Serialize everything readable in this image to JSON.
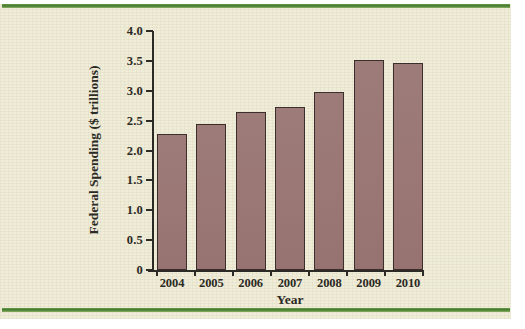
{
  "figure": {
    "background_color": "#efecd8",
    "rule_color": "#3f7a2c",
    "bar_fill_color": "#9a7774",
    "bar_edge_color": "#3b2e2c",
    "axis_color": "#2b2a24"
  },
  "chart_data": {
    "type": "bar",
    "title": "",
    "xlabel": "Year",
    "ylabel": "Federal Spending ($ trillions)",
    "categories": [
      "2004",
      "2005",
      "2006",
      "2007",
      "2008",
      "2009",
      "2010"
    ],
    "values": [
      2.28,
      2.45,
      2.65,
      2.72,
      2.98,
      3.52,
      3.46
    ],
    "ylim": [
      0,
      4.0
    ],
    "yticks": [
      0,
      0.5,
      1.0,
      1.5,
      2.0,
      2.5,
      3.0,
      3.5,
      4.0
    ],
    "ytick_labels": [
      "0",
      "0.5",
      "1.0",
      "1.5",
      "2.0",
      "2.5",
      "3.0",
      "3.5",
      "4.0"
    ],
    "grid": false,
    "legend": false
  }
}
